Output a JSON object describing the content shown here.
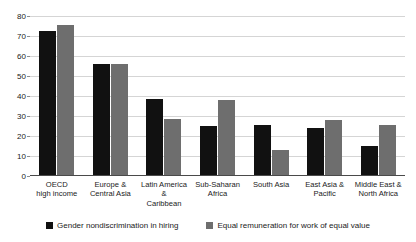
{
  "chart_data": {
    "type": "bar",
    "title": "",
    "xlabel": "",
    "ylabel": "",
    "ylim": [
      0,
      80
    ],
    "yticks": [
      0,
      10,
      20,
      30,
      40,
      50,
      60,
      70,
      80
    ],
    "grid": true,
    "legend_position": "bottom",
    "categories": [
      "OECD\nhigh income",
      "Europe &\nCentral Asia",
      "Latin America &\nCaribbean",
      "Sub-Saharan\nAfrica",
      "South Asia",
      "East Asia &\nPacific",
      "Middle East &\nNorth Africa"
    ],
    "series": [
      {
        "name": "Gender nondiscrimination in hiring",
        "color": "#111111",
        "values": [
          72.5,
          56,
          38.5,
          25,
          25.5,
          24,
          15
        ]
      },
      {
        "name": "Equal remuneration for work of equal value",
        "color": "#6e6e6e",
        "values": [
          75.5,
          56,
          28.5,
          38,
          13,
          28,
          25.5
        ]
      }
    ]
  },
  "axis": {
    "y_tick_labels": [
      "0",
      "10",
      "20",
      "30",
      "40",
      "50",
      "60",
      "70",
      "80"
    ]
  },
  "legend": {
    "items": [
      {
        "label": "Gender nondiscrimination in hiring",
        "color": "#111111"
      },
      {
        "label": "Equal remuneration for work of equal value",
        "color": "#6e6e6e"
      }
    ]
  },
  "colors": {
    "series_0": "#111111",
    "series_1": "#6e6e6e",
    "gridline": "#d5d5d5",
    "axis": "#4a4a4a",
    "background": "#ffffff"
  }
}
